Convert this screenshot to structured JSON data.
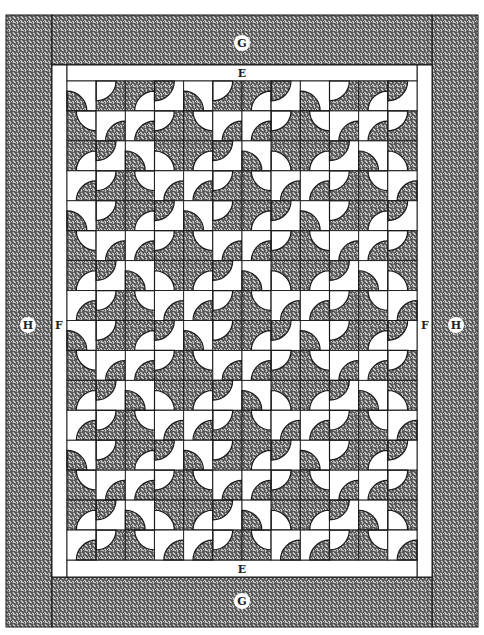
{
  "diagram": {
    "colors": {
      "dark_fabric": "#4a4a4a",
      "print_light": "#d8d8d8",
      "background": "#ffffff",
      "line": "#1a1a1a"
    },
    "labels": {
      "top_outer_border": "G",
      "bottom_outer_border": "G",
      "top_inner_border": "E",
      "bottom_inner_border": "E",
      "left_inner_border": "F",
      "right_inner_border": "F",
      "left_outer_border": "H",
      "right_outer_border": "H"
    },
    "grid": {
      "columns": 12,
      "rows": 16,
      "repeat_tile": [
        [
          "bl-d",
          "tl-l",
          "br-l",
          "tl-d"
        ],
        [
          "tr-l",
          "br-d",
          "br-d",
          "tl-l"
        ],
        [
          "br-l",
          "tl-d",
          "bl-d",
          "bl-l"
        ],
        [
          "br-d",
          "tl-l",
          "tr-l",
          "br-d"
        ]
      ],
      "cell_legend": {
        "corner": "tl/tr/bl/br = corner holding the quarter-circle",
        "d": "dark quarter-circle on light square",
        "l": "light quarter-circle on dark square"
      }
    }
  }
}
